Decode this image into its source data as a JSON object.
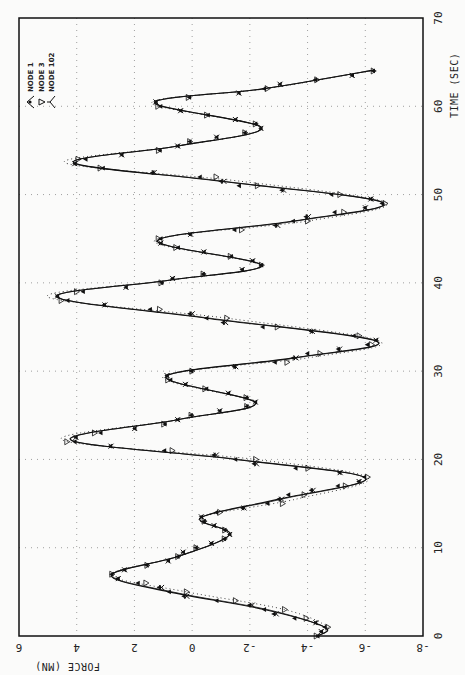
{
  "chart_data": {
    "type": "line",
    "orientation": "rotated-90-clockwise",
    "title": "",
    "xlabel": "TIME (SEC)",
    "ylabel": "FORCE (MN)",
    "xlim": [
      0,
      70
    ],
    "ylim": [
      -8,
      6
    ],
    "x_ticks": [
      0,
      10,
      20,
      30,
      40,
      50,
      60,
      70
    ],
    "y_ticks": [
      6,
      4,
      2,
      0,
      -2,
      -4,
      -6,
      -8
    ],
    "grid": true,
    "legend_position": "top-left (rotated)",
    "series": [
      {
        "name": "NODE 1",
        "marker": "filled-triangle",
        "line": "solid",
        "x": [
          0,
          1,
          3,
          5,
          6.9,
          9,
          11.5,
          13.4,
          15.5,
          17.9,
          20,
          22.2,
          24.5,
          26.4,
          29.4,
          31.5,
          33.4,
          36,
          38.4,
          40.3,
          42,
          44.8,
          47,
          49.1,
          51.5,
          53.6,
          55.5,
          57.6,
          60.4,
          62,
          64.1
        ],
        "values": [
          -4.35,
          -4.6,
          -2.5,
          0.8,
          2.8,
          0.5,
          -1.3,
          -0.3,
          -3.0,
          -6.0,
          -1.5,
          4.2,
          0.5,
          -2.2,
          0.9,
          -3.5,
          -6.4,
          -0.5,
          4.7,
          0.8,
          -2.4,
          1.2,
          -3.5,
          -6.6,
          -1.0,
          4.1,
          0.5,
          -2.4,
          1.3,
          -2.5,
          -6.3
        ]
      },
      {
        "name": "NODE 3",
        "marker": "open-triangle",
        "line": "dotted",
        "x": [
          0,
          1,
          3,
          5,
          6.9,
          9,
          11.5,
          13.4,
          15.5,
          17.9,
          20,
          22.2,
          24.5,
          26.4,
          29.4,
          31.5,
          33.4,
          36,
          38.4,
          40.3,
          42,
          44.8,
          47,
          49.1,
          51.5,
          53.6,
          55.5,
          57.6,
          60.4,
          62,
          64.1
        ],
        "values": [
          -4.3,
          -4.7,
          -3.2,
          0.2,
          2.8,
          0.5,
          -1.3,
          -0.3,
          -3.6,
          -6.1,
          -2.2,
          4.5,
          0.5,
          -2.2,
          1.0,
          -4.0,
          -6.5,
          -1.2,
          5.0,
          0.8,
          -2.4,
          1.3,
          -4.0,
          -6.7,
          -1.7,
          4.4,
          0.5,
          -2.4,
          1.4,
          -2.6,
          -6.3
        ]
      },
      {
        "name": "NODE 102",
        "marker": "triangle-tick",
        "line": "solid",
        "x": [
          0,
          1,
          3,
          5,
          6.9,
          9,
          11.5,
          13.4,
          15.5,
          17.9,
          20,
          22.2,
          24.5,
          26.4,
          29.4,
          31.5,
          33.4,
          36,
          38.4,
          40.3,
          42,
          44.8,
          47,
          49.1,
          51.5,
          53.6,
          55.5,
          57.6,
          60.4,
          62,
          64.1
        ],
        "values": [
          -4.35,
          -4.6,
          -2.6,
          0.7,
          2.8,
          0.5,
          -1.3,
          -0.3,
          -3.1,
          -6.0,
          -1.6,
          4.2,
          0.5,
          -2.2,
          0.9,
          -3.6,
          -6.4,
          -0.6,
          4.7,
          0.8,
          -2.4,
          1.2,
          -3.6,
          -6.6,
          -1.1,
          4.1,
          0.5,
          -2.4,
          1.3,
          -2.5,
          -6.3
        ]
      }
    ]
  },
  "labels": {
    "time_axis_title": "TIME (SEC)",
    "force_axis_title": "FORCE (MN)",
    "legend": [
      "NODE 1",
      "NODE 3",
      "NODE 102"
    ]
  },
  "colors": {
    "background": "#fbfbfa",
    "line": "#111111",
    "grid": "#888888",
    "frame": "#111111"
  }
}
